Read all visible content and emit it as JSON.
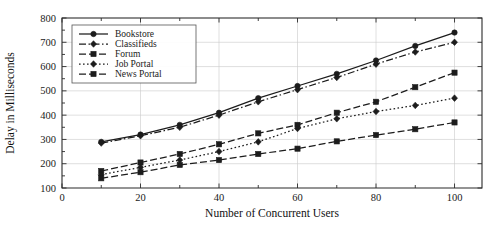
{
  "chart_data": {
    "type": "line",
    "title": "",
    "xlabel": "Number of Concurrent Users",
    "ylabel": "Delay in Milliseconds",
    "xlim": [
      0,
      107
    ],
    "ylim": [
      100,
      800
    ],
    "xticks": [
      0,
      10,
      20,
      30,
      40,
      50,
      60,
      70,
      80,
      90,
      100
    ],
    "xticklabels": [
      "0",
      "",
      "20",
      "",
      "40",
      "",
      "60",
      "",
      "80",
      "",
      "100"
    ],
    "yticks": [
      100,
      200,
      300,
      400,
      500,
      600,
      700,
      800
    ],
    "yticklabels": [
      "100",
      "200",
      "300",
      "400",
      "500",
      "600",
      "700",
      "800"
    ],
    "grid": true,
    "legend_position": "upper-left",
    "x": [
      10,
      20,
      30,
      40,
      50,
      60,
      70,
      80,
      90,
      100
    ],
    "series": [
      {
        "name": "Bookstore",
        "marker": "circle",
        "dash": "solid",
        "values": [
          290,
          320,
          360,
          410,
          470,
          520,
          570,
          625,
          685,
          740
        ]
      },
      {
        "name": "Classifieds",
        "marker": "diamond",
        "dash": "dashdot",
        "values": [
          285,
          315,
          350,
          400,
          455,
          505,
          555,
          610,
          660,
          700
        ]
      },
      {
        "name": "Forum",
        "marker": "square",
        "dash": "dashed",
        "values": [
          170,
          205,
          240,
          280,
          325,
          360,
          410,
          455,
          515,
          575
        ]
      },
      {
        "name": "Job Portal",
        "marker": "diamond",
        "dash": "dotted",
        "values": [
          155,
          185,
          215,
          250,
          290,
          345,
          385,
          415,
          440,
          470
        ]
      },
      {
        "name": "News Portal",
        "marker": "square",
        "dash": "dashed",
        "values": [
          140,
          165,
          195,
          215,
          240,
          262,
          292,
          318,
          342,
          370
        ]
      }
    ]
  },
  "legend": {
    "entries": [
      "Bookstore",
      "Classifieds",
      "Forum",
      "Job Portal",
      "News Portal"
    ]
  },
  "colors": {
    "ink": "#1c1c1c",
    "grid": "#c9c9c9",
    "background": "#ffffff"
  }
}
